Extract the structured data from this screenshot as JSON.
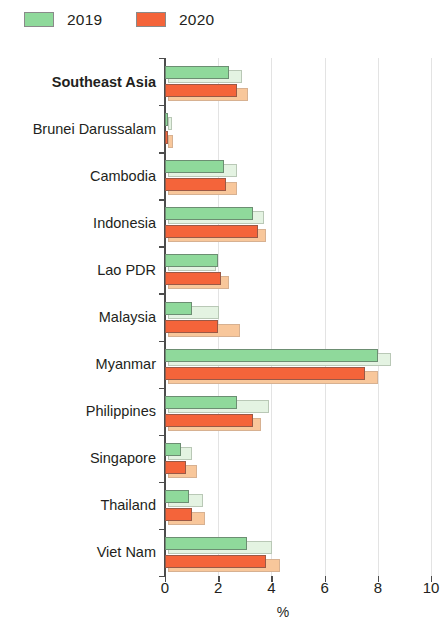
{
  "legend": {
    "position": "top-left",
    "items": [
      {
        "label": "2019",
        "color": "#8fd99b",
        "icon": "legend-swatch-green"
      },
      {
        "label": "2020",
        "color": "#f4643a",
        "icon": "legend-swatch-orange"
      }
    ]
  },
  "axis": {
    "x_title": "%",
    "x_ticks": [
      "0",
      "2",
      "4",
      "6",
      "8",
      "10"
    ]
  },
  "chart_data": {
    "type": "bar",
    "orientation": "horizontal",
    "title": "",
    "subtitle": "",
    "xlabel": "%",
    "ylabel": "",
    "xlim": [
      0,
      10
    ],
    "xticks": [
      0,
      2,
      4,
      6,
      8,
      10
    ],
    "grid": true,
    "legend_position": "top-left",
    "categories": [
      "Southeast Asia",
      "Brunei Darussalam",
      "Cambodia",
      "Indonesia",
      "Lao PDR",
      "Malaysia",
      "Myanmar",
      "Philippines",
      "Singapore",
      "Thailand",
      "Viet Nam"
    ],
    "highlight_category": "Southeast Asia",
    "series": [
      {
        "name": "2019",
        "color": "#8fd99b",
        "values": [
          2.4,
          0.1,
          2.2,
          3.3,
          2.0,
          1.0,
          8.0,
          2.7,
          0.6,
          0.9,
          3.1
        ]
      },
      {
        "name": "2020",
        "color": "#f4643a",
        "values": [
          2.7,
          0.1,
          2.3,
          3.5,
          2.1,
          2.0,
          7.5,
          3.3,
          0.8,
          1.0,
          3.8
        ]
      }
    ],
    "shadow_values": {
      "2019": [
        2.8,
        0.15,
        2.6,
        3.6,
        1.8,
        1.9,
        8.4,
        3.8,
        0.9,
        1.3,
        3.9
      ],
      "2020": [
        3.0,
        0.2,
        2.6,
        3.7,
        2.3,
        2.7,
        7.9,
        3.5,
        1.1,
        1.4,
        4.2
      ]
    }
  }
}
